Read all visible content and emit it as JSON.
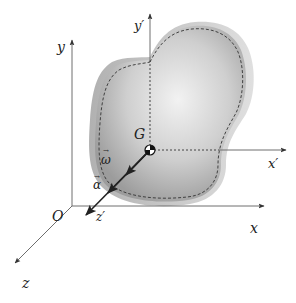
{
  "diagram": {
    "type": "rigid-body kinematics",
    "labels": {
      "fixed_y": "y",
      "fixed_x": "x",
      "fixed_z": "z",
      "origin": "O",
      "body_y": "y′",
      "body_x": "x′",
      "body_z": "z′",
      "center_of_mass": "G",
      "angular_velocity": "ω",
      "angular_acceleration": "α",
      "vector_bar": "→"
    },
    "colors": {
      "axis": "#6e6e6e",
      "arrowhead": "#333333",
      "body_fill_light": "#e6e6e6",
      "body_fill_dark": "#9a9a9a",
      "body_edge": "#b8b8b8",
      "dashed_outline": "#333333",
      "vector": "#222222"
    }
  }
}
